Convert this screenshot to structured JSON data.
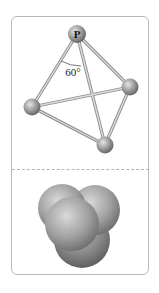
{
  "figure": {
    "type": "molecular-structure",
    "molecule": "P4 (white phosphorus)",
    "ball_and_stick": {
      "atom_label": "P",
      "angle_label": "60°",
      "atoms": [
        {
          "id": "top",
          "label": "P",
          "cx": 77,
          "cy": 34
        },
        {
          "id": "right",
          "label": "",
          "cx": 130,
          "cy": 87
        },
        {
          "id": "left",
          "label": "",
          "cx": 32,
          "cy": 107
        },
        {
          "id": "bottom",
          "label": "",
          "cx": 105,
          "cy": 145
        }
      ],
      "bonds": [
        [
          "top",
          "right"
        ],
        [
          "top",
          "left"
        ],
        [
          "top",
          "bottom"
        ],
        [
          "left",
          "right"
        ],
        [
          "left",
          "bottom"
        ],
        [
          "right",
          "bottom"
        ]
      ]
    },
    "space_filling": {
      "description": "space-filling model of P4"
    },
    "colors": {
      "card_border": "#b9b9b9",
      "divider": "#b5b5b5",
      "atom_light": "#d6d6d6",
      "atom_dark": "#6f6f6f",
      "bond": "#a9a9a9"
    }
  }
}
